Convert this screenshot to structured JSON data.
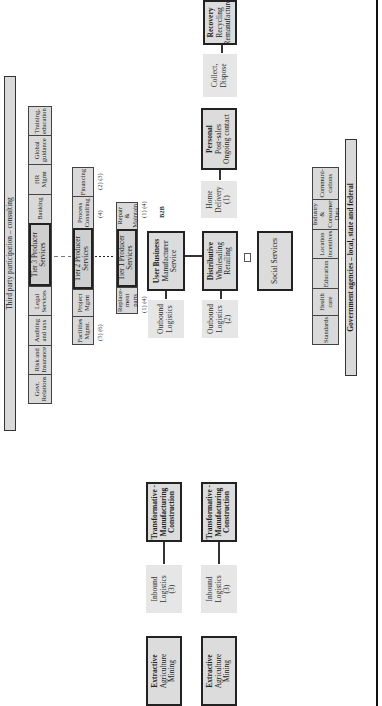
{
  "banners": {
    "third_party": "Third party participation – consulting",
    "government": "Government agencies – local, state and federal"
  },
  "top_row": {
    "cells": [
      "Govt. Relations",
      "Risk and Insurance",
      "Auditing and taxs",
      "Legal Services",
      "Tier 3 Producer Services",
      "Banking",
      "HR Mgmt",
      "Global guidance",
      "Training, education"
    ]
  },
  "tier2_row": {
    "cells": [
      "Facilities Mgmt.",
      "Project Mgmt",
      "Tier 2 Producer Services",
      "Process Consulting",
      "Financing"
    ],
    "notes": [
      "(5) (6)",
      "(4)",
      "(2) (3)"
    ]
  },
  "tier1_row": {
    "cells": [
      "Replace-ment parts",
      "Tier 1 Producer Services",
      "Repair & Maintain"
    ],
    "notes": [
      "(1) (4)",
      "(1) (4)"
    ]
  },
  "b2b_label": "B2B",
  "chain_top": [
    {
      "title": "Extractive",
      "lines": [
        "Agriculture",
        "Mining"
      ],
      "style": "bold"
    },
    {
      "title": "",
      "lines": [
        "Inbound",
        "Logistics",
        "(3)"
      ],
      "style": "light"
    },
    {
      "title": "Transformative -",
      "lines": [
        "Manufacturing",
        "Construction"
      ],
      "style": "bold-all"
    },
    {
      "title": "",
      "lines": [
        "Outbound",
        "Logistics"
      ],
      "style": "light"
    },
    {
      "title": "User Business",
      "lines": [
        "Manufacturer",
        "Service"
      ],
      "style": "bold"
    }
  ],
  "chain_bottom": [
    {
      "title": "Extractive",
      "lines": [
        "Agriculture",
        "Mining"
      ],
      "style": "bold"
    },
    {
      "title": "",
      "lines": [
        "Inbound",
        "Logistics",
        "(3)"
      ],
      "style": "light"
    },
    {
      "title": "Transformative -",
      "lines": [
        "Manufacturing",
        "Construction"
      ],
      "style": "bold-all"
    },
    {
      "title": "",
      "lines": [
        "Outbound",
        "Logistics",
        "(2)"
      ],
      "style": "light"
    },
    {
      "title": "Distributive",
      "lines": [
        "Wholesaling",
        "Retailing"
      ],
      "style": "bold"
    },
    {
      "title": "",
      "lines": [
        "Home",
        "Delivery",
        "(1)"
      ],
      "style": "light"
    },
    {
      "title": "Personal",
      "lines": [
        "Post-sales",
        "Ongoing contact"
      ],
      "style": "bold"
    },
    {
      "title": "",
      "lines": [
        "Collect,",
        "Dispose"
      ],
      "style": "light"
    },
    {
      "title": "Recovery",
      "lines": [
        "Recycling",
        "Remanufacture"
      ],
      "style": "bold"
    }
  ],
  "social_services": "Social Services",
  "gov_row": {
    "cells": [
      "Standards",
      "Health care",
      "Education",
      "Location incentives",
      "Industry & Consumer Data",
      "Communi-cations"
    ]
  },
  "colors": {
    "box_fill": "#d9d9d9",
    "light_fill": "#e6e6e6",
    "border": "#222222",
    "background": "#ffffff"
  }
}
